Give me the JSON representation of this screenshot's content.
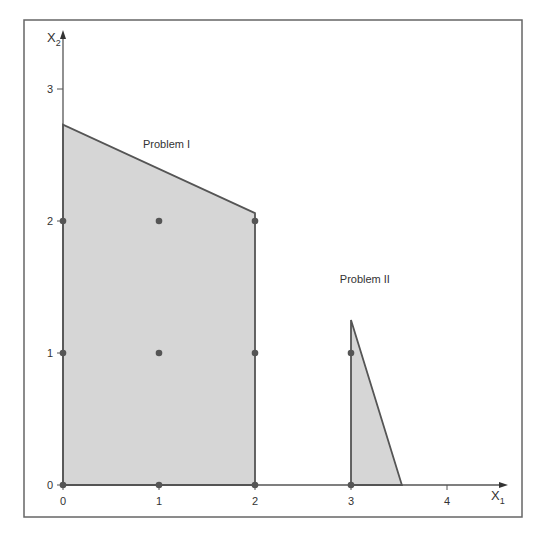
{
  "figure": {
    "frame": {
      "x": 24,
      "y": 20,
      "width": 498,
      "height": 497,
      "stroke": "#666666"
    },
    "axes": {
      "origin_px": [
        63,
        485
      ],
      "x_unit_px": 96,
      "y_unit_px": 132,
      "x_label": "X",
      "x_label_sub": "1",
      "y_label": "X",
      "y_label_sub": "2",
      "x_ticks": [
        "0",
        "1",
        "2",
        "3",
        "4"
      ],
      "y_ticks": [
        "0",
        "1",
        "2",
        "3"
      ],
      "line_color": "#555555"
    },
    "colors": {
      "region_fill": "#d6d6d6",
      "region_stroke": "#555555",
      "dot": "#555555"
    },
    "regions": [
      {
        "name": "Problem I",
        "label": "Problem I",
        "label_pos": [
          1.0,
          2.55
        ],
        "vertices": [
          [
            0,
            0
          ],
          [
            0,
            2.73
          ],
          [
            2,
            2.06
          ],
          [
            2,
            0
          ]
        ]
      },
      {
        "name": "Problem II",
        "label": "Problem II",
        "label_pos": [
          3.05,
          1.53
        ],
        "vertices": [
          [
            3,
            0
          ],
          [
            3,
            1.25
          ],
          [
            3.53,
            0
          ]
        ]
      }
    ],
    "integer_points": [
      [
        0,
        0
      ],
      [
        1,
        0
      ],
      [
        2,
        0
      ],
      [
        3,
        0
      ],
      [
        0,
        1
      ],
      [
        1,
        1
      ],
      [
        2,
        1
      ],
      [
        3,
        1
      ],
      [
        0,
        2
      ],
      [
        1,
        2
      ],
      [
        2,
        2
      ]
    ]
  },
  "chart_data": {
    "type": "diagram",
    "title": "",
    "xlabel": "X1",
    "ylabel": "X2",
    "xlim": [
      0,
      4.5
    ],
    "ylim": [
      0,
      3.4
    ],
    "x_ticks": [
      0,
      1,
      2,
      3,
      4
    ],
    "y_ticks": [
      0,
      1,
      2,
      3
    ],
    "regions": [
      {
        "name": "Problem I",
        "vertices": [
          [
            0,
            0
          ],
          [
            0,
            2.73
          ],
          [
            2,
            2.06
          ],
          [
            2,
            0
          ]
        ]
      },
      {
        "name": "Problem II",
        "vertices": [
          [
            3,
            0
          ],
          [
            3,
            1.25
          ],
          [
            3.53,
            0
          ]
        ]
      }
    ],
    "points": [
      [
        0,
        0
      ],
      [
        1,
        0
      ],
      [
        2,
        0
      ],
      [
        3,
        0
      ],
      [
        0,
        1
      ],
      [
        1,
        1
      ],
      [
        2,
        1
      ],
      [
        3,
        1
      ],
      [
        0,
        2
      ],
      [
        1,
        2
      ],
      [
        2,
        2
      ]
    ]
  }
}
